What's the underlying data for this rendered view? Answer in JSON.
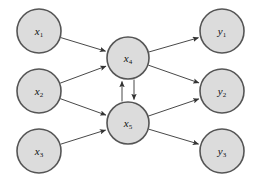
{
  "diagram": {
    "title": "",
    "background_color": "#ffffff",
    "node_fill_color": "#dcdcdc",
    "node_stroke_color": "#555555",
    "edge_color": "#333333",
    "layers": [
      {
        "name": "input-layer",
        "nodes": [
          {
            "id": "x1",
            "base": "x",
            "sub": "1",
            "cx": 39,
            "cy": 31,
            "r": 22
          },
          {
            "id": "x2",
            "base": "x",
            "sub": "2",
            "cx": 39,
            "cy": 91,
            "r": 22
          },
          {
            "id": "x3",
            "base": "x",
            "sub": "3",
            "cx": 39,
            "cy": 151,
            "r": 22
          }
        ]
      },
      {
        "name": "hidden-layer",
        "nodes": [
          {
            "id": "x4",
            "base": "x",
            "sub": "4",
            "cx": 128,
            "cy": 58,
            "r": 21
          },
          {
            "id": "x5",
            "base": "x",
            "sub": "5",
            "cx": 128,
            "cy": 123,
            "r": 21
          }
        ]
      },
      {
        "name": "output-layer",
        "nodes": [
          {
            "id": "y1",
            "base": "y",
            "sub": "1",
            "cx": 222,
            "cy": 31,
            "r": 22
          },
          {
            "id": "y2",
            "base": "y",
            "sub": "2",
            "cx": 222,
            "cy": 91,
            "r": 22
          },
          {
            "id": "y3",
            "base": "y",
            "sub": "3",
            "cx": 222,
            "cy": 151,
            "r": 22
          }
        ]
      }
    ],
    "edges": [
      {
        "id": "x1-x4",
        "from": "x1",
        "to": "x4",
        "directed": true
      },
      {
        "id": "x2-x4",
        "from": "x2",
        "to": "x4",
        "directed": true
      },
      {
        "id": "x2-x5",
        "from": "x2",
        "to": "x5",
        "directed": true
      },
      {
        "id": "x3-x5",
        "from": "x3",
        "to": "x5",
        "directed": true
      },
      {
        "id": "x4-y1",
        "from": "x4",
        "to": "y1",
        "directed": true
      },
      {
        "id": "x4-y2",
        "from": "x4",
        "to": "y2",
        "directed": true
      },
      {
        "id": "x5-y2",
        "from": "x5",
        "to": "y2",
        "directed": true
      },
      {
        "id": "x5-y3",
        "from": "x5",
        "to": "y3",
        "directed": true
      }
    ],
    "recurrent_edges": [
      {
        "id": "x5-x4-up",
        "from": "x5",
        "to": "x4",
        "directed": true,
        "offset": -6
      },
      {
        "id": "x4-x5-down",
        "from": "x4",
        "to": "x5",
        "directed": true,
        "offset": 6
      }
    ]
  }
}
